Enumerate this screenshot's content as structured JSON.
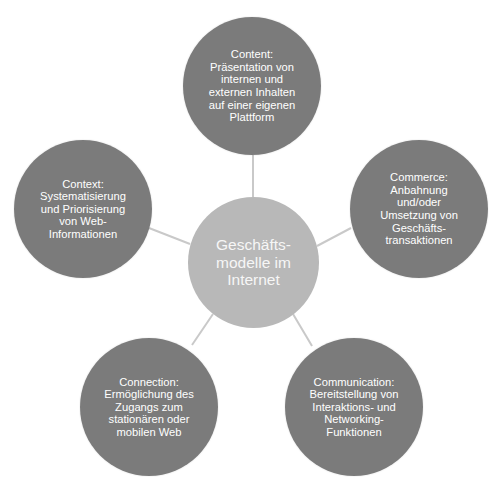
{
  "diagram": {
    "type": "radial-cycle",
    "colors": {
      "outer_node": "#7b7b7b",
      "center_node": "#b8b8b8",
      "connector": "#c9c9c9",
      "text": "#ffffff"
    },
    "center": {
      "label": "Geschäfts-\nmodelle im\nInternet"
    },
    "nodes": [
      {
        "id": "content",
        "label": "Content:\nPräsentation von\ninternen und\nexternen Inhalten\nauf einer eigenen\nPlattform"
      },
      {
        "id": "commerce",
        "label": "Commerce:\nAnbahnung\nund/oder\nUmsetzung von\nGeschäfts-\ntransaktionen"
      },
      {
        "id": "communication",
        "label": "Communication:\nBereitstellung von\nInteraktions- und\nNetworking-\nFunktionen"
      },
      {
        "id": "connection",
        "label": "Connection:\nErmöglichung des\nZugangs zum\nstationären oder\nmobilen Web"
      },
      {
        "id": "context",
        "label": "Context:\nSystematisierung\nund Priorisierung\nvon Web-\nInformationen"
      }
    ]
  }
}
